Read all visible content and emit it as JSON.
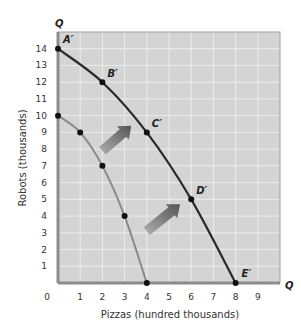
{
  "chart_data": {
    "type": "line",
    "title": "",
    "xlabel": "Pizzas (hundred thousands)",
    "ylabel": "Robots (thousands)",
    "x_axis_letter": "Q",
    "y_axis_letter": "Q",
    "xlim": [
      0,
      10
    ],
    "ylim": [
      0,
      15
    ],
    "x_ticks": [
      "0",
      "1",
      "2",
      "3",
      "4",
      "5",
      "6",
      "7",
      "8",
      "9"
    ],
    "y_ticks": [
      "1",
      "2",
      "3",
      "4",
      "5",
      "6",
      "7",
      "8",
      "9",
      "10",
      "11",
      "12",
      "13",
      "14"
    ],
    "grid": true,
    "series": [
      {
        "name": "Original PPF",
        "color": "#8a8a8a",
        "points": [
          {
            "x": 0,
            "y": 10
          },
          {
            "x": 1,
            "y": 9
          },
          {
            "x": 2,
            "y": 7
          },
          {
            "x": 3,
            "y": 4
          },
          {
            "x": 4,
            "y": 0
          }
        ]
      },
      {
        "name": "New PPF",
        "color": "#2a2a2a",
        "points": [
          {
            "x": 0,
            "y": 14,
            "label": "A′"
          },
          {
            "x": 2,
            "y": 12,
            "label": "B′"
          },
          {
            "x": 4,
            "y": 9,
            "label": "C′"
          },
          {
            "x": 6,
            "y": 5,
            "label": "D′"
          },
          {
            "x": 8,
            "y": 0,
            "label": "E′"
          }
        ]
      }
    ],
    "annotations": [
      {
        "type": "arrow",
        "description": "outward shift arrow",
        "from": [
          2.0,
          7.9
        ],
        "to": [
          3.3,
          9.4
        ]
      },
      {
        "type": "arrow",
        "description": "outward shift arrow",
        "from": [
          4.0,
          3.1
        ],
        "to": [
          5.5,
          4.7
        ]
      }
    ],
    "colors": {
      "plot_background": "#d4d4d4",
      "grid": "#ececec",
      "axis": "#8c8c8c"
    }
  }
}
